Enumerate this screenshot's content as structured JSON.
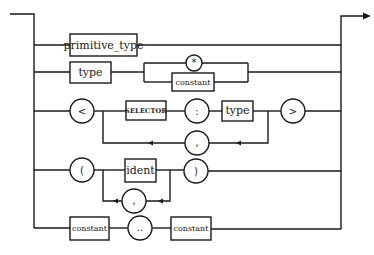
{
  "diagram": {
    "kind": "syntax-railroad-diagram",
    "rows": [
      {
        "id": "row-primitive",
        "items": [
          {
            "kind": "nonterminal",
            "label": "primitive_type"
          }
        ]
      },
      {
        "id": "row-type-array",
        "items": [
          {
            "kind": "nonterminal",
            "label": "type"
          },
          {
            "kind": "alternative",
            "options": [
              {
                "kind": "terminal",
                "label": "*"
              },
              {
                "kind": "nonterminal",
                "label": "constant"
              }
            ]
          }
        ]
      },
      {
        "id": "row-record",
        "items": [
          {
            "kind": "terminal",
            "label": "<"
          },
          {
            "kind": "nonterminal",
            "label": "SELECTOR"
          },
          {
            "kind": "terminal",
            "label": ":"
          },
          {
            "kind": "nonterminal",
            "label": "type"
          },
          {
            "kind": "terminal",
            "label": ">"
          }
        ],
        "repeat_separator": ","
      },
      {
        "id": "row-enum",
        "items": [
          {
            "kind": "terminal",
            "label": "("
          },
          {
            "kind": "nonterminal",
            "label": "ident"
          },
          {
            "kind": "terminal",
            "label": ")"
          }
        ],
        "repeat_separator": ","
      },
      {
        "id": "row-range",
        "items": [
          {
            "kind": "nonterminal",
            "label": "constant"
          },
          {
            "kind": "terminal",
            "label": ".."
          },
          {
            "kind": "nonterminal",
            "label": "constant"
          }
        ]
      }
    ],
    "labels": {
      "primitive_type": "primitive_type",
      "type": "type",
      "star": "*",
      "constant": "constant",
      "lt": "<",
      "selector": "SELECTOR",
      "colon": ":",
      "gt": ">",
      "comma": ",",
      "lparen": "(",
      "ident": "ident",
      "rparen": ")",
      "range": ".."
    },
    "colors": {
      "stroke": "#1a1a1a",
      "background": "#ffffff"
    }
  }
}
